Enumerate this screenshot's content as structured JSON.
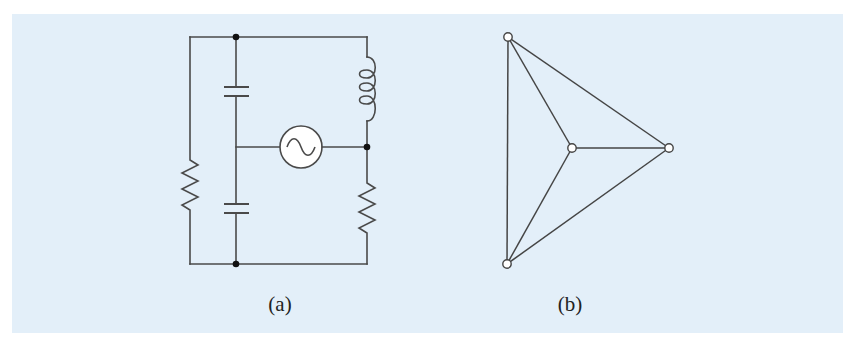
{
  "figure": {
    "background_color": "#e3eff9",
    "line_color": "#4a4a4a",
    "panels": [
      {
        "id": "a",
        "label": "(a)",
        "type": "circuit",
        "components": [
          {
            "kind": "resistor",
            "position": "left branch"
          },
          {
            "kind": "capacitor",
            "position": "middle branch, upper"
          },
          {
            "kind": "capacitor",
            "position": "middle branch, lower"
          },
          {
            "kind": "inductor",
            "position": "right branch, upper"
          },
          {
            "kind": "resistor",
            "position": "right branch, lower"
          },
          {
            "kind": "ac-source",
            "position": "center, between middle and right branches"
          }
        ],
        "junction_dots": 3
      },
      {
        "id": "b",
        "label": "(b)",
        "type": "graph",
        "nodes": [
          "top-left",
          "center",
          "right",
          "bottom-left"
        ],
        "edges": [
          [
            "top-left",
            "bottom-left"
          ],
          [
            "top-left",
            "center"
          ],
          [
            "top-left",
            "right"
          ],
          [
            "center",
            "right"
          ],
          [
            "center",
            "bottom-left"
          ],
          [
            "bottom-left",
            "right"
          ]
        ]
      }
    ]
  }
}
